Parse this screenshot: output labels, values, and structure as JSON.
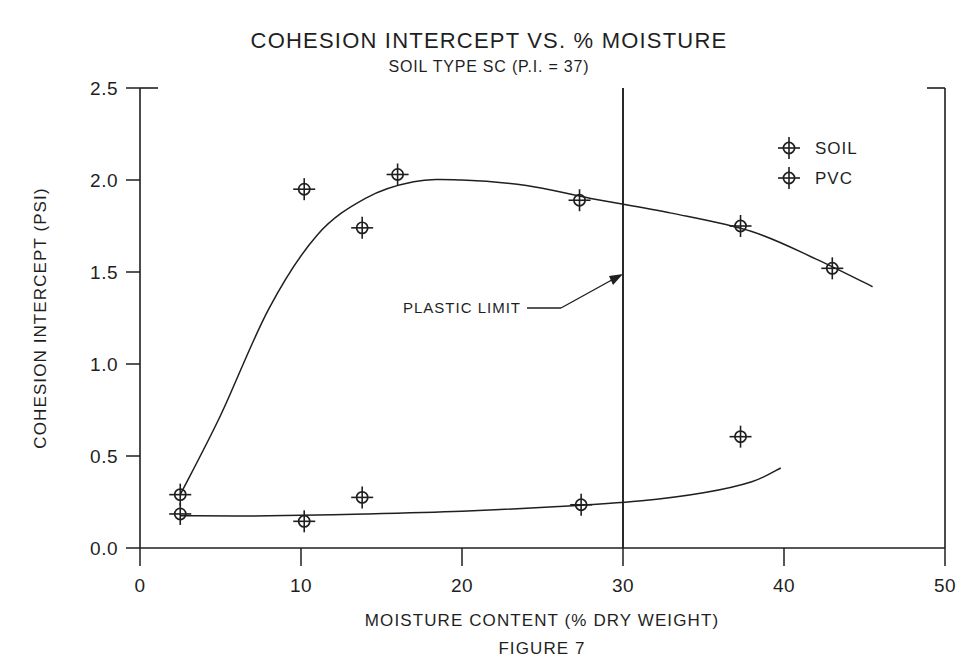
{
  "chart_data": {
    "type": "scatter",
    "title": "COHESION INTERCEPT VS. % MOISTURE",
    "subtitle": "SOIL TYPE SC (P.I. = 37)",
    "caption": "FIGURE 7",
    "xlabel": "MOISTURE CONTENT (% DRY WEIGHT)",
    "ylabel": "COHESION INTERCEPT  (PSI)",
    "xlim": [
      0,
      50
    ],
    "ylim": [
      0.0,
      2.5
    ],
    "xticks": [
      0,
      10,
      20,
      30,
      40,
      50
    ],
    "xtick_labels": [
      "0",
      "10",
      "20",
      "30",
      "40",
      "50"
    ],
    "yticks": [
      0.0,
      0.5,
      1.0,
      1.5,
      2.0,
      2.5
    ],
    "ytick_labels": [
      "0.0",
      "0.5",
      "1.0",
      "1.5",
      "2.0",
      "2.5"
    ],
    "grid": false,
    "legend_position": "upper right",
    "marker_style": "circle-with-crosshair",
    "line_color": "#1f1f1f",
    "series": [
      {
        "name": "SOIL",
        "marker": "circle-crosshair",
        "points": [
          {
            "x": 2.5,
            "y": 0.29
          },
          {
            "x": 10.2,
            "y": 1.95
          },
          {
            "x": 13.8,
            "y": 1.74
          },
          {
            "x": 16.0,
            "y": 2.03
          },
          {
            "x": 27.3,
            "y": 1.89
          },
          {
            "x": 37.3,
            "y": 1.75
          },
          {
            "x": 43.0,
            "y": 1.52
          }
        ],
        "fit_curve": [
          {
            "x": 2.5,
            "y": 0.29
          },
          {
            "x": 5.0,
            "y": 0.72
          },
          {
            "x": 8.0,
            "y": 1.3
          },
          {
            "x": 11.0,
            "y": 1.7
          },
          {
            "x": 14.0,
            "y": 1.9
          },
          {
            "x": 17.0,
            "y": 1.99
          },
          {
            "x": 20.0,
            "y": 2.0
          },
          {
            "x": 24.0,
            "y": 1.97
          },
          {
            "x": 28.0,
            "y": 1.9
          },
          {
            "x": 33.0,
            "y": 1.82
          },
          {
            "x": 38.0,
            "y": 1.72
          },
          {
            "x": 42.0,
            "y": 1.57
          },
          {
            "x": 45.5,
            "y": 1.42
          }
        ]
      },
      {
        "name": "PVC",
        "marker": "circle-crosshair",
        "points": [
          {
            "x": 2.5,
            "y": 0.185
          },
          {
            "x": 10.2,
            "y": 0.145
          },
          {
            "x": 13.8,
            "y": 0.275
          },
          {
            "x": 27.4,
            "y": 0.235
          },
          {
            "x": 37.3,
            "y": 0.605
          }
        ],
        "fit_curve": [
          {
            "x": 2.5,
            "y": 0.175
          },
          {
            "x": 8.0,
            "y": 0.175
          },
          {
            "x": 14.0,
            "y": 0.185
          },
          {
            "x": 20.0,
            "y": 0.2
          },
          {
            "x": 26.0,
            "y": 0.225
          },
          {
            "x": 31.0,
            "y": 0.255
          },
          {
            "x": 35.0,
            "y": 0.3
          },
          {
            "x": 38.0,
            "y": 0.36
          },
          {
            "x": 39.8,
            "y": 0.435
          }
        ]
      }
    ],
    "annotations": [
      {
        "label": "PLASTIC LIMIT",
        "x_value": 30,
        "type": "vertical-line-with-leader"
      }
    ]
  },
  "legend": {
    "entries": [
      {
        "label": "SOIL"
      },
      {
        "label": "PVC"
      }
    ]
  }
}
